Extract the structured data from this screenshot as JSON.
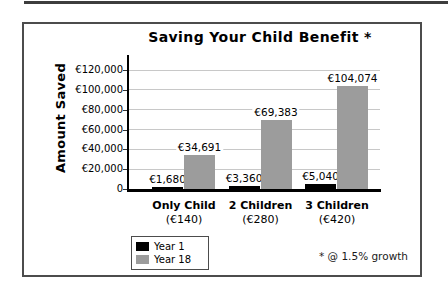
{
  "chart_data": {
    "type": "bar",
    "title": "Saving Your Child Benefit *",
    "ylabel": "Amount Saved",
    "xlabel": "",
    "categories": [
      "Only Child",
      "2 Children",
      "3 Children"
    ],
    "category_sublabels": [
      "(€140)",
      "(€280)",
      "(€420)"
    ],
    "series": [
      {
        "name": "Year 1",
        "color": "#000000",
        "values": [
          1680,
          3360,
          5040
        ],
        "data_labels": [
          "€1,680",
          "€3,360",
          "€5,040"
        ]
      },
      {
        "name": "Year 18",
        "color": "#9c9c9c",
        "values": [
          34691,
          69383,
          104074
        ],
        "data_labels": [
          "€34,691",
          "€69,383",
          "€104,074"
        ]
      }
    ],
    "ylim": [
      0,
      120000
    ],
    "y_tick_step": 20000,
    "y_tick_labels": [
      "0",
      "€20,000",
      "€40,000",
      "€60,000",
      "€80,000",
      "€100,000",
      "€120,000"
    ],
    "grid": true,
    "legend_position": "bottom-left",
    "annotation": "* @ 1.5% growth",
    "colors": {
      "grid": "#c8c8c8",
      "axis": "#000000",
      "frame": "#4c4c4c"
    }
  }
}
